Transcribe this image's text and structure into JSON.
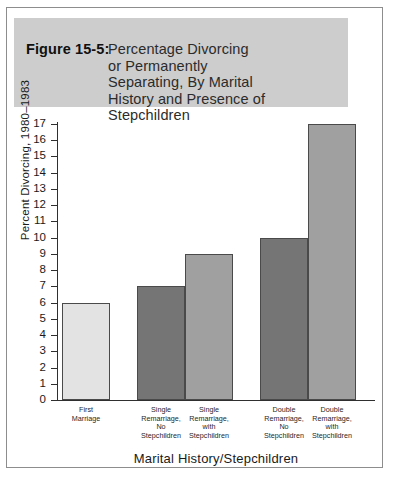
{
  "figure": {
    "label": "Figure 15-5:",
    "title_body": "Percentage Divorcing\nor Permanently\nSeparating, By Marital\nHistory and Presence of\nStepchildren",
    "banner_color": "#cdcdcd",
    "frame_color": "#8d8d8d"
  },
  "chart_data": {
    "type": "bar",
    "title": "Figure 15-5: Percentage Divorcing or Permanently Separating, By Marital History and Presence of Stepchildren",
    "xlabel": "Marital History/Stepchildren",
    "ylabel": "Percent Divorcing, 1980–1983",
    "categories": [
      "First\nMarriage",
      "Single\nRemarriage,\nNo\nStepchildren",
      "Single\nRemarriage,\nwith\nStepchildren",
      "Double\nRemarriage,\nNo\nStepchildren",
      "Double\nRemarriage,\nwith\nStepchildren"
    ],
    "values": [
      6,
      7,
      9,
      10,
      17
    ],
    "bar_colors": [
      "#e3e3e3",
      "#757575",
      "#a0a0a0",
      "#757575",
      "#a0a0a0"
    ],
    "bar_border_color": "#4a4a4a",
    "ylim": [
      0,
      17
    ],
    "ytick_step": 1,
    "ytick_labels": [
      "17",
      "16",
      "15",
      "14",
      "13",
      "12",
      "11",
      "10",
      "9",
      "8",
      "7",
      "6",
      "5",
      "4",
      "3",
      "2",
      "1",
      "0"
    ],
    "grid": false,
    "legend": "none"
  }
}
